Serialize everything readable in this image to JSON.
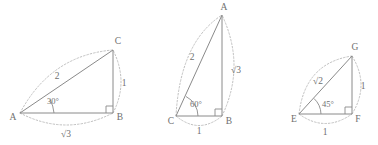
{
  "figure": {
    "background_color": "#ffffff",
    "line_color": "#8a8a8a",
    "arc_color": "#b9b9b9",
    "text_color": "#6f6f6f"
  },
  "triangles": [
    {
      "id": "triangle-30-60-90-left",
      "vertices": [
        {
          "name": "A",
          "label": "A",
          "x": 20,
          "y": 113
        },
        {
          "name": "B",
          "label": "B",
          "x": 113,
          "y": 113
        },
        {
          "name": "C",
          "label": "C",
          "x": 113,
          "y": 50
        }
      ],
      "angle": {
        "label": "30°",
        "at": "A",
        "x": 44,
        "y": 101
      },
      "right_angle_at": "B",
      "sides": [
        {
          "name": "hypotenuse-AC",
          "label": "2",
          "x": 57,
          "y": 76
        },
        {
          "name": "leg-BC",
          "label": "1",
          "x": 124,
          "y": 83
        },
        {
          "name": "leg-AB",
          "label": "√3",
          "x": 66,
          "y": 133
        }
      ]
    },
    {
      "id": "triangle-30-60-90-middle",
      "vertices": [
        {
          "name": "C",
          "label": "C",
          "x": 176,
          "y": 116
        },
        {
          "name": "B",
          "label": "B",
          "x": 222,
          "y": 116
        },
        {
          "name": "A",
          "label": "A",
          "x": 222,
          "y": 15
        }
      ],
      "angle": {
        "label": "60°",
        "at": "C",
        "x": 189,
        "y": 104
      },
      "right_angle_at": "B",
      "sides": [
        {
          "name": "hypotenuse-CA",
          "label": "2",
          "x": 192,
          "y": 57
        },
        {
          "name": "leg-AB",
          "label": "√3",
          "x": 234,
          "y": 70
        },
        {
          "name": "leg-CB",
          "label": "1",
          "x": 199,
          "y": 131
        }
      ]
    },
    {
      "id": "triangle-45-45-90-right",
      "vertices": [
        {
          "name": "E",
          "label": "E",
          "x": 299,
          "y": 114
        },
        {
          "name": "F",
          "label": "F",
          "x": 352,
          "y": 114
        },
        {
          "name": "G",
          "label": "G",
          "x": 352,
          "y": 56
        }
      ],
      "angle": {
        "label": "45°",
        "at": "E",
        "x": 320,
        "y": 104
      },
      "right_angle_at": "F",
      "sides": [
        {
          "name": "hypotenuse-EG",
          "label": "√2",
          "x": 317,
          "y": 81
        },
        {
          "name": "leg-FG",
          "label": "1",
          "x": 363,
          "y": 86
        },
        {
          "name": "leg-EF",
          "label": "1",
          "x": 325,
          "y": 132
        }
      ]
    }
  ]
}
